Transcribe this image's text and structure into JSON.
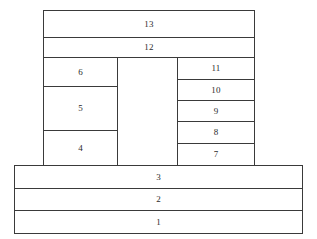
{
  "diagram": {
    "type": "layered-cross-section",
    "background_color": "#ffffff",
    "line_color": "#3a3a3a",
    "label_color": "#2b2b2b",
    "top_stack": [
      {
        "label": "13",
        "x": 43,
        "y": 10,
        "w": 212,
        "h": 28
      },
      {
        "label": "12",
        "x": 43,
        "y": 37,
        "w": 212,
        "h": 21
      }
    ],
    "left_column": [
      {
        "label": "6",
        "x": 43,
        "y": 57,
        "w": 75,
        "h": 30
      },
      {
        "label": "5",
        "x": 43,
        "y": 86,
        "w": 75,
        "h": 45
      },
      {
        "label": "4",
        "x": 43,
        "y": 130,
        "w": 75,
        "h": 36
      }
    ],
    "center_column": [
      {
        "label": "",
        "x": 117,
        "y": 57,
        "w": 61,
        "h": 109
      }
    ],
    "right_column": [
      {
        "label": "11",
        "x": 177,
        "y": 57,
        "w": 78,
        "h": 23
      },
      {
        "label": "10",
        "x": 177,
        "y": 79,
        "w": 78,
        "h": 22
      },
      {
        "label": "9",
        "x": 177,
        "y": 100,
        "w": 78,
        "h": 22
      },
      {
        "label": "8",
        "x": 177,
        "y": 121,
        "w": 78,
        "h": 23
      },
      {
        "label": "7",
        "x": 177,
        "y": 143,
        "w": 78,
        "h": 23
      }
    ],
    "substrate_stack": [
      {
        "label": "3",
        "x": 14,
        "y": 165,
        "w": 289,
        "h": 24
      },
      {
        "label": "2",
        "x": 14,
        "y": 188,
        "w": 289,
        "h": 23
      },
      {
        "label": "1",
        "x": 14,
        "y": 210,
        "w": 289,
        "h": 24
      }
    ]
  }
}
